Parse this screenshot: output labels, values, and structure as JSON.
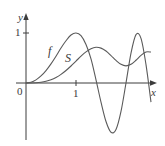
{
  "chart_data": {
    "type": "line",
    "title": "",
    "xlabel": "x",
    "ylabel": "y",
    "xlim": [
      0,
      2.5
    ],
    "ylim": [
      -1,
      1
    ],
    "x_ticks": [
      {
        "value": 0,
        "label": "0"
      },
      {
        "value": 1,
        "label": "1"
      }
    ],
    "y_ticks": [
      {
        "value": 1,
        "label": "1"
      }
    ],
    "grid": false,
    "legend": "inline labels",
    "x": [
      0,
      0.1,
      0.2,
      0.3,
      0.4,
      0.5,
      0.6,
      0.7,
      0.8,
      0.9,
      1.0,
      1.1,
      1.2,
      1.3,
      1.4,
      1.5,
      1.6,
      1.7,
      1.8,
      1.9,
      2.0,
      2.1,
      2.2,
      2.3,
      2.4,
      2.5
    ],
    "series": [
      {
        "name": "f",
        "values": [
          0,
          0.0157,
          0.0628,
          0.1409,
          0.2487,
          0.3827,
          0.5358,
          0.6997,
          0.8443,
          0.9592,
          1.0,
          0.9468,
          0.7705,
          0.4818,
          0.0628,
          -0.3827,
          -0.7705,
          -0.9851,
          -0.9298,
          -0.5688,
          0,
          0.5979,
          0.9686,
          0.8934,
          0.3681,
          -0.3827
        ]
      },
      {
        "name": "S",
        "values": [
          0,
          0.0005,
          0.0042,
          0.0141,
          0.0334,
          0.0647,
          0.1105,
          0.1721,
          0.2493,
          0.3398,
          0.4383,
          0.5365,
          0.6234,
          0.6863,
          0.7135,
          0.6975,
          0.6389,
          0.5492,
          0.4509,
          0.3733,
          0.3434,
          0.3743,
          0.4557,
          0.5532,
          0.6194,
          0.6192
        ]
      }
    ],
    "annotations": [
      {
        "text": "f",
        "near_x": 0.5,
        "series": "f"
      },
      {
        "text": "S",
        "near_x": 0.85,
        "series": "S"
      }
    ]
  },
  "labels": {
    "y_axis": "y",
    "x_axis": "x",
    "origin": "0",
    "x_tick_1": "1",
    "y_tick_1": "1",
    "curve_f": "f",
    "curve_s": "S"
  },
  "colors": {
    "axis": "#3c3c3c",
    "curve": "#5a5a5a"
  }
}
